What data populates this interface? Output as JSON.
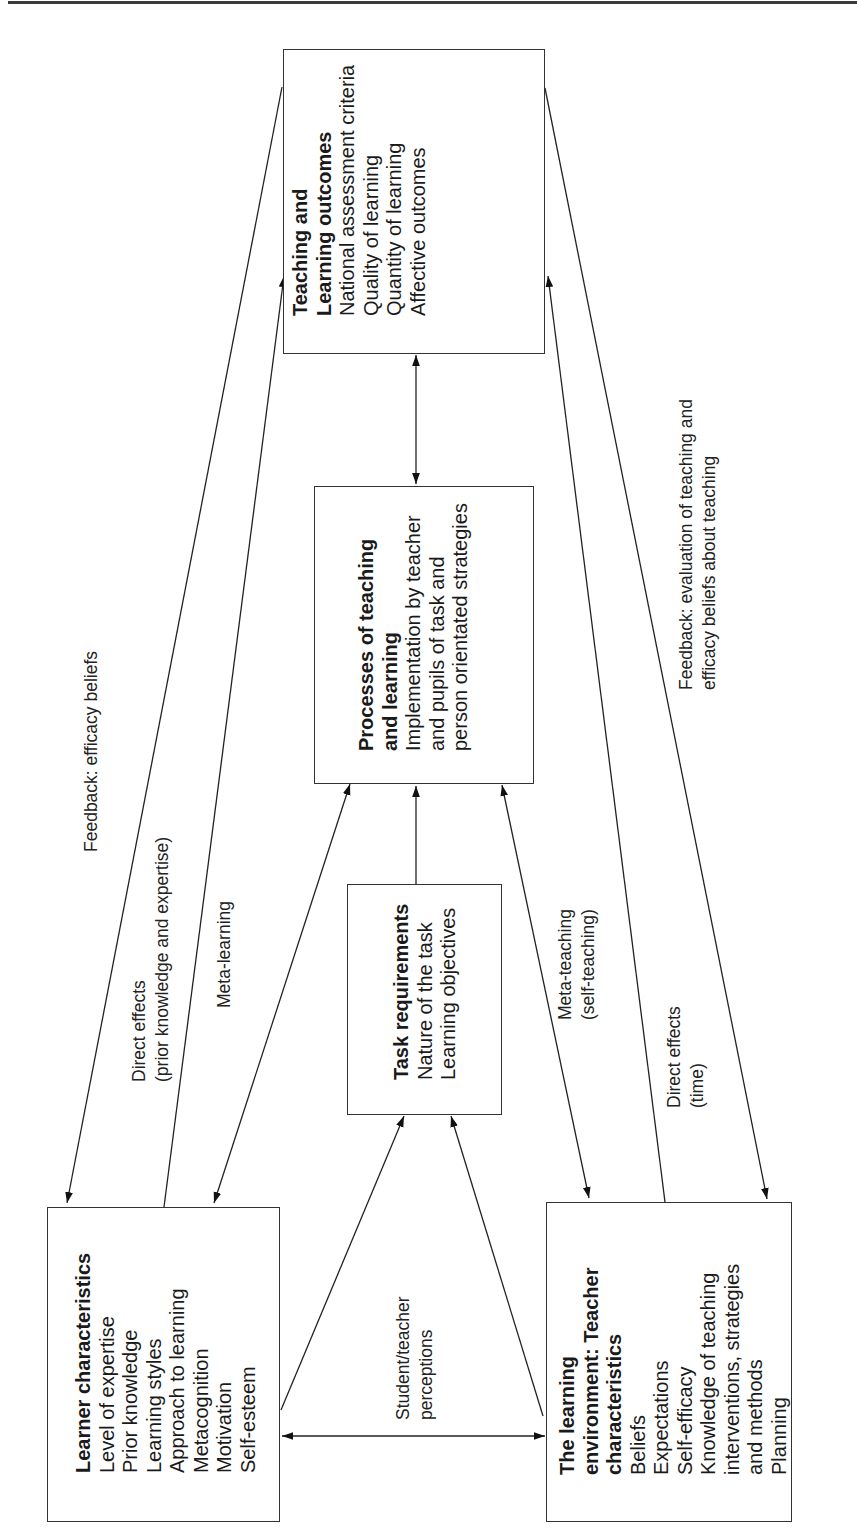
{
  "diagram": {
    "orientation": "rotated -90deg (landscape figure on portrait page)",
    "boxes": {
      "outcomes": {
        "title_lines": [
          "Teaching and",
          "Learning outcomes"
        ],
        "items": [
          "National assessment criteria",
          "Quality of learning",
          "Quantity of learning",
          "Affective outcomes"
        ]
      },
      "processes": {
        "title_lines": [
          "Processes of teaching",
          "and learning"
        ],
        "items": [
          "Implementation by teacher",
          "and pupils of task and",
          "person orientated strategies"
        ]
      },
      "task": {
        "title_lines": [
          "Task requirements"
        ],
        "items": [
          "Nature of the task",
          "Learning objectives"
        ]
      },
      "learner": {
        "title_lines": [
          "Learner characteristics"
        ],
        "items": [
          "Level of expertise",
          "Prior knowledge",
          "Learning styles",
          "Approach to learning",
          "Metacognition",
          "Motivation",
          "Self-esteem"
        ]
      },
      "teacher": {
        "title_lines": [
          "The learning",
          "environment: Teacher",
          "characteristics"
        ],
        "items": [
          "Beliefs",
          "Expectations",
          "Self-efficacy",
          "Knowledge of teaching",
          "interventions, strategies",
          "and methods",
          "Planning"
        ]
      }
    },
    "edge_labels": {
      "feedback_learner": [
        "Feedback: efficacy beliefs"
      ],
      "direct_learner": [
        "Direct effects",
        "(prior knowledge and expertise)"
      ],
      "meta_learning": [
        "Meta-learning"
      ],
      "meta_teaching": [
        "Meta-teaching",
        "(self-teaching)"
      ],
      "direct_teacher": [
        "Direct effects",
        "(time)"
      ],
      "feedback_teacher": [
        "Feedback: evaluation of teaching and",
        "efficacy beliefs about teaching"
      ],
      "perceptions": [
        "Student/teacher",
        "perceptions"
      ]
    },
    "edges": [
      {
        "from": "outcomes",
        "to": "learner",
        "label": "feedback_learner",
        "arrow": "end"
      },
      {
        "from": "learner",
        "to": "outcomes",
        "label": "direct_learner",
        "arrow": "end"
      },
      {
        "from": "learner",
        "to": "processes",
        "label": "meta_learning",
        "arrow": "both"
      },
      {
        "from": "task",
        "to": "processes",
        "arrow": "end"
      },
      {
        "from": "processes",
        "to": "outcomes",
        "arrow": "both"
      },
      {
        "from": "teacher",
        "to": "processes",
        "label": "meta_teaching",
        "arrow": "both"
      },
      {
        "from": "teacher",
        "to": "outcomes",
        "label": "direct_teacher",
        "arrow": "end"
      },
      {
        "from": "outcomes",
        "to": "teacher",
        "label": "feedback_teacher",
        "arrow": "end"
      },
      {
        "from": "learner",
        "to": "task",
        "arrow": "end"
      },
      {
        "from": "teacher",
        "to": "task",
        "arrow": "end"
      },
      {
        "from": "learner",
        "to": "teacher",
        "label": "perceptions",
        "arrow": "both"
      }
    ],
    "colors": {
      "line": "#222222",
      "background": "#ffffff",
      "text": "#1a1a1a"
    }
  }
}
